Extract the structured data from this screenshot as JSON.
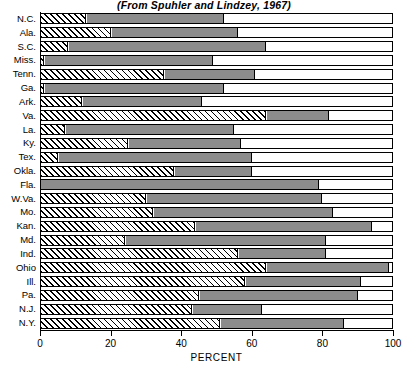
{
  "chart_data": {
    "type": "bar",
    "orientation": "horizontal",
    "stacked": true,
    "title": "(From Spuhler and Lindzey, 1967)",
    "xlabel": "PERCENT",
    "ylabel": "",
    "xlim": [
      0,
      100
    ],
    "xticks": [
      0,
      20,
      40,
      60,
      80,
      100
    ],
    "xticklabels": [
      "0",
      "20",
      "40",
      "60",
      "80",
      "100"
    ],
    "grid": false,
    "legend": "none",
    "categories": [
      "N.C.",
      "Ala.",
      "S.C.",
      "Miss.",
      "Tenn.",
      "Ga.",
      "Ark.",
      "Va.",
      "La.",
      "Ky.",
      "Tex.",
      "Okla.",
      "Fla.",
      "W.Va.",
      "Mo.",
      "Kan.",
      "Md.",
      "Ind.",
      "Ohio",
      "Ill.",
      "Pa.",
      "N.J.",
      "N.Y."
    ],
    "series": [
      {
        "name": "hatched",
        "style": "diagonal-hatch",
        "values": [
          13,
          20,
          8,
          1,
          35,
          1,
          12,
          64,
          7,
          25,
          5,
          38,
          0,
          30,
          32,
          44,
          24,
          56,
          64,
          58,
          45,
          43,
          51
        ]
      },
      {
        "name": "gray",
        "style": "solid-gray",
        "values": [
          39,
          36,
          56,
          48,
          26,
          51,
          34,
          18,
          48,
          32,
          55,
          22,
          79,
          50,
          51,
          50,
          57,
          25,
          35,
          33,
          45,
          20,
          35
        ]
      },
      {
        "name": "white",
        "style": "solid-white",
        "values": [
          48,
          44,
          36,
          51,
          39,
          48,
          54,
          18,
          45,
          43,
          40,
          40,
          21,
          20,
          17,
          6,
          19,
          19,
          1,
          9,
          10,
          37,
          14
        ]
      }
    ],
    "cumulative_boundaries": [
      {
        "category": "N.C.",
        "hatch_end": 13,
        "gray_end": 52
      },
      {
        "category": "Ala.",
        "hatch_end": 20,
        "gray_end": 56
      },
      {
        "category": "S.C.",
        "hatch_end": 8,
        "gray_end": 64
      },
      {
        "category": "Miss.",
        "hatch_end": 1,
        "gray_end": 49
      },
      {
        "category": "Tenn.",
        "hatch_end": 35,
        "gray_end": 61
      },
      {
        "category": "Ga.",
        "hatch_end": 1,
        "gray_end": 52
      },
      {
        "category": "Ark.",
        "hatch_end": 12,
        "gray_end": 46
      },
      {
        "category": "Va.",
        "hatch_end": 64,
        "gray_end": 82
      },
      {
        "category": "La.",
        "hatch_end": 7,
        "gray_end": 55
      },
      {
        "category": "Ky.",
        "hatch_end": 25,
        "gray_end": 57
      },
      {
        "category": "Tex.",
        "hatch_end": 5,
        "gray_end": 60
      },
      {
        "category": "Okla.",
        "hatch_end": 38,
        "gray_end": 60
      },
      {
        "category": "Fla.",
        "hatch_end": 0,
        "gray_end": 79
      },
      {
        "category": "W.Va.",
        "hatch_end": 30,
        "gray_end": 80
      },
      {
        "category": "Mo.",
        "hatch_end": 32,
        "gray_end": 83
      },
      {
        "category": "Kan.",
        "hatch_end": 44,
        "gray_end": 94
      },
      {
        "category": "Md.",
        "hatch_end": 24,
        "gray_end": 81
      },
      {
        "category": "Ind.",
        "hatch_end": 56,
        "gray_end": 81
      },
      {
        "category": "Ohio",
        "hatch_end": 64,
        "gray_end": 99
      },
      {
        "category": "Ill.",
        "hatch_end": 58,
        "gray_end": 91
      },
      {
        "category": "Pa.",
        "hatch_end": 45,
        "gray_end": 90
      },
      {
        "category": "N.J.",
        "hatch_end": 43,
        "gray_end": 63
      },
      {
        "category": "N.Y.",
        "hatch_end": 51,
        "gray_end": 86
      }
    ],
    "colors": {
      "hatch_fill": "#ffffff",
      "hatch_line": "#000000",
      "gray_fill": "#8c8c8c",
      "white_fill": "#fefefe",
      "outline": "#000000",
      "text": "#000000",
      "background": "#ffffff"
    }
  }
}
